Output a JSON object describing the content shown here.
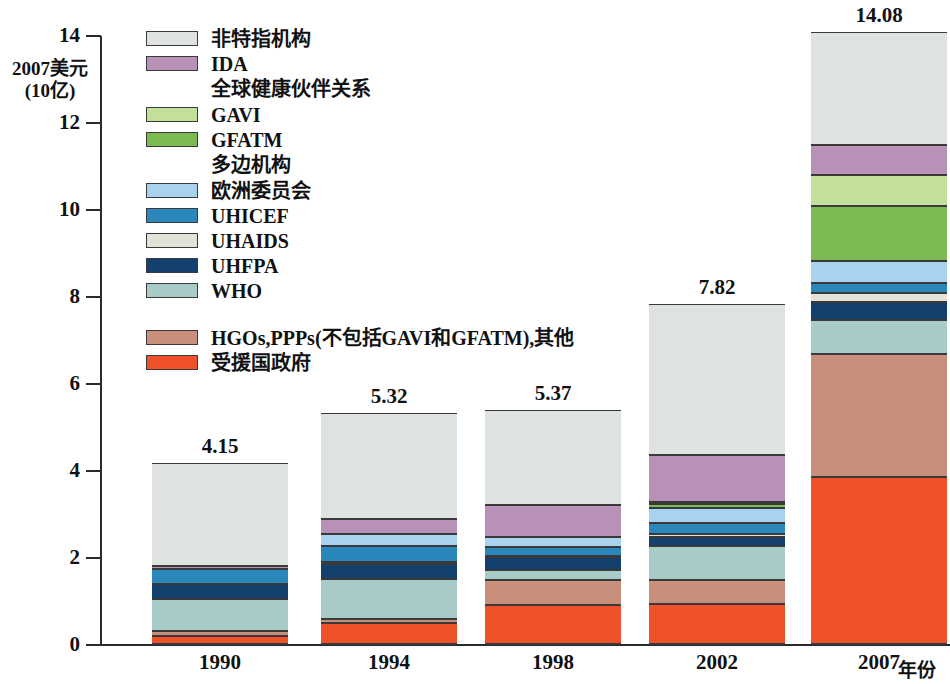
{
  "axis": {
    "y_title": "2007美元\n(10亿)",
    "y_title_line1": "2007美元",
    "y_title_line2": "(10亿)",
    "x_title": "年份",
    "y_ticks": [
      "0",
      "2",
      "4",
      "6",
      "8",
      "10",
      "12",
      "14"
    ]
  },
  "legend": {
    "entries": [
      {
        "label": "非特指机构",
        "color": "#dfe3e0",
        "swatch": true
      },
      {
        "label": "IDA",
        "color": "#b892b6",
        "swatch": true
      },
      {
        "label": "全球健康伙伴关系",
        "color": "",
        "swatch": false
      },
      {
        "label": "GAVI",
        "color": "#c2e09a",
        "swatch": true
      },
      {
        "label": "GFATM",
        "color": "#7cba52",
        "swatch": true
      },
      {
        "label": "多边机构",
        "color": "",
        "swatch": false
      },
      {
        "label": "欧洲委员会",
        "color": "#a9d2ee",
        "swatch": true
      },
      {
        "label": "UHICEF",
        "color": "#2b87bb",
        "swatch": true
      },
      {
        "label": "UHAIDS",
        "color": "#e3e2d8",
        "swatch": true
      },
      {
        "label": "UHFPA",
        "color": "#14406e",
        "swatch": true
      },
      {
        "label": "WHO",
        "color": "#a7cbc7",
        "swatch": true
      }
    ],
    "entries_lower": [
      {
        "label": "HGOs,PPPs(不包括GAVI和GFATM),其他",
        "color": "#c8907c",
        "swatch": true
      },
      {
        "label": "受援国政府",
        "color": "#ef512b",
        "swatch": true
      }
    ]
  },
  "chart_data": {
    "type": "bar",
    "subtype": "stacked",
    "title": "",
    "xlabel": "年份",
    "ylabel": "2007美元 (10亿)",
    "ylim": [
      0,
      14
    ],
    "ytick_step": 2,
    "grid": false,
    "legend_position": "upper-left-inside",
    "categories": [
      "1990",
      "1994",
      "1998",
      "2002",
      "2007"
    ],
    "totals": [
      4.15,
      5.32,
      5.37,
      7.82,
      14.08
    ],
    "series": [
      {
        "name": "受援国政府",
        "color": "#ef512b",
        "values": [
          0.18,
          0.48,
          0.9,
          0.93,
          3.85
        ]
      },
      {
        "name": "HGOs,PPPs(不包括GAVI和GFATM),其他",
        "color": "#c8907c",
        "values": [
          0.12,
          0.1,
          0.58,
          0.55,
          2.82
        ]
      },
      {
        "name": "WHO",
        "color": "#a7cbc7",
        "values": [
          0.73,
          0.92,
          0.22,
          0.78,
          0.78
        ]
      },
      {
        "name": "UHFPA",
        "color": "#14406e",
        "values": [
          0.35,
          0.35,
          0.3,
          0.2,
          0.42
        ]
      },
      {
        "name": "UHAIDS",
        "color": "#e3e2d8",
        "values": [
          0.0,
          0.03,
          0.02,
          0.07,
          0.19
        ]
      },
      {
        "name": "UHICEF",
        "color": "#2b87bb",
        "values": [
          0.35,
          0.38,
          0.22,
          0.25,
          0.23
        ]
      },
      {
        "name": "欧洲委员会",
        "color": "#a9d2ee",
        "values": [
          0.0,
          0.28,
          0.22,
          0.35,
          0.51
        ]
      },
      {
        "name": "GFATM",
        "color": "#7cba52",
        "values": [
          0.0,
          0.0,
          0.0,
          0.08,
          1.28
        ]
      },
      {
        "name": "GAVI",
        "color": "#c2e09a",
        "values": [
          0.0,
          0.0,
          0.0,
          0.05,
          0.7
        ]
      },
      {
        "name": "IDA",
        "color": "#b892b6",
        "values": [
          0.07,
          0.33,
          0.73,
          1.08,
          0.69
        ]
      },
      {
        "name": "非特指机构",
        "color": "#dfe3e0",
        "values": [
          2.35,
          2.45,
          2.18,
          3.48,
          2.61
        ]
      }
    ]
  }
}
